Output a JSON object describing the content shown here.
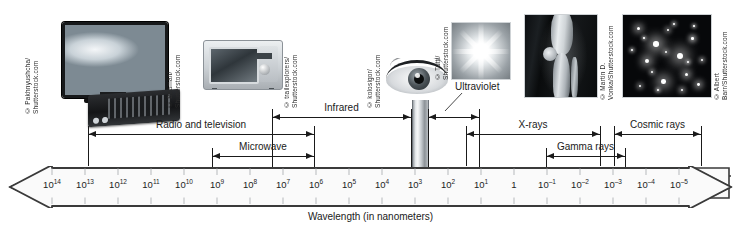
{
  "figure": {
    "caption": "Wavelength (in nanometers)",
    "axis_direction": "bidirectional"
  },
  "chart_data": {
    "type": "line",
    "xlabel": "Wavelength (in nanometers)",
    "ylabel": "",
    "orientation": "horizontal",
    "scale": "logarithmic",
    "axis_ticks": [
      {
        "label": "10¹⁴",
        "base": "10",
        "exp": "14",
        "exponent": 14,
        "x": 52
      },
      {
        "label": "10¹³",
        "base": "10",
        "exp": "13",
        "exponent": 13,
        "x": 85
      },
      {
        "label": "10¹²",
        "base": "10",
        "exp": "12",
        "exponent": 12,
        "x": 118
      },
      {
        "label": "10¹¹",
        "base": "10",
        "exp": "11",
        "exponent": 11,
        "x": 151
      },
      {
        "label": "10¹⁰",
        "base": "10",
        "exp": "10",
        "exponent": 10,
        "x": 184
      },
      {
        "label": "10⁹",
        "base": "10",
        "exp": "9",
        "exponent": 9,
        "x": 217
      },
      {
        "label": "10⁸",
        "base": "10",
        "exp": "8",
        "exponent": 8,
        "x": 250
      },
      {
        "label": "10⁷",
        "base": "10",
        "exp": "7",
        "exponent": 7,
        "x": 283
      },
      {
        "label": "10⁶",
        "base": "10",
        "exp": "6",
        "exponent": 6,
        "x": 316
      },
      {
        "label": "10⁵",
        "base": "10",
        "exp": "5",
        "exponent": 5,
        "x": 349
      },
      {
        "label": "10⁴",
        "base": "10",
        "exp": "4",
        "exponent": 4,
        "x": 382
      },
      {
        "label": "10³",
        "base": "10",
        "exp": "3",
        "exponent": 3,
        "x": 415
      },
      {
        "label": "10²",
        "base": "10",
        "exp": "2",
        "exponent": 2,
        "x": 448
      },
      {
        "label": "10¹",
        "base": "10",
        "exp": "1",
        "exponent": 1,
        "x": 481
      },
      {
        "label": "1",
        "base": "1",
        "exp": "",
        "exponent": 0,
        "x": 514
      },
      {
        "label": "10⁻¹",
        "base": "10",
        "exp": "–1",
        "exponent": -1,
        "x": 547
      },
      {
        "label": "10⁻²",
        "base": "10",
        "exp": "–2",
        "exponent": -2,
        "x": 580
      },
      {
        "label": "10⁻³",
        "base": "10",
        "exp": "–3",
        "exponent": -3,
        "x": 613
      },
      {
        "label": "10⁻⁴",
        "base": "10",
        "exp": "–4",
        "exponent": -4,
        "x": 646
      },
      {
        "label": "10⁻⁵",
        "base": "10",
        "exp": "–5",
        "exponent": -5,
        "x": 679
      }
    ],
    "bands": [
      {
        "name": "Radio and television",
        "label": "Radio and television",
        "start_exponent": 14,
        "end_exponent": 6,
        "x_start": 88,
        "x_end": 314,
        "y": 134,
        "label_y": 119,
        "arrow_left": true,
        "arrow_right": true
      },
      {
        "name": "Microwave",
        "label": "Microwave",
        "start_exponent": 9,
        "end_exponent": 6,
        "x_start": 212,
        "x_end": 314,
        "y": 156,
        "label_y": 141,
        "arrow_left": true,
        "arrow_right": true
      },
      {
        "name": "Infrared",
        "label": "Infrared",
        "start_exponent": 6,
        "end_exponent": 3,
        "x_start": 272,
        "x_end": 411,
        "y": 117,
        "label_y": 102,
        "arrow_left": true,
        "arrow_right": true
      },
      {
        "name": "Visible light",
        "label": "",
        "start_exponent": 3,
        "end_exponent": 2.6,
        "x_start": 412,
        "x_end": 427,
        "y": 117,
        "label_y": 0,
        "arrow_left": false,
        "arrow_right": false
      },
      {
        "name": "Ultraviolet",
        "label": "Ultraviolet",
        "start_exponent": 2.6,
        "end_exponent": 1,
        "x_start": 428,
        "x_end": 479,
        "y": 117,
        "label_y": 82,
        "arrow_left": true,
        "arrow_right": true
      },
      {
        "name": "X-rays",
        "label": "X-rays",
        "start_exponent": 1,
        "end_exponent": -3,
        "x_start": 466,
        "x_end": 600,
        "y": 134,
        "label_y": 119,
        "arrow_left": true,
        "arrow_right": true
      },
      {
        "name": "Gamma rays",
        "label": "Gamma rays",
        "start_exponent": -2,
        "end_exponent": -4,
        "x_start": 546,
        "x_end": 625,
        "y": 156,
        "label_y": 141,
        "arrow_left": true,
        "arrow_right": true
      },
      {
        "name": "Cosmic rays",
        "label": "Cosmic rays",
        "start_exponent": -3,
        "end_exponent": -5,
        "x_start": 614,
        "x_end": 701,
        "y": 134,
        "label_y": 119,
        "arrow_left": true,
        "arrow_right": true
      }
    ]
  },
  "images": [
    {
      "name": "television-photo",
      "credit": "© Pakhnyushcha/\nShutterstock.com"
    },
    {
      "name": "microwave-photo",
      "credit": "© Beaman/\nShutterstock.com"
    },
    {
      "name": "remote-radio-photo",
      "credit": "© trailexplorers/\nShutterstock.com"
    },
    {
      "name": "eye-photo",
      "credit": "© kolosigor/\nShutterstock.com"
    },
    {
      "name": "sun-photo",
      "credit": "© Tutti/\nShutterstock.com"
    },
    {
      "name": "xray-knee-photo",
      "credit": "© Martin D. Vonka/Shutterstock.com"
    },
    {
      "name": "cosmic-rays-photo",
      "credit": "© Albert Barr/Shutterstock.com"
    }
  ],
  "colors": {
    "background": "#ffffff",
    "ink": "#1a1a1a",
    "axis_stroke": "#3a3a3a",
    "axis_fill": "#fafafa",
    "tick": "#b6b9bc"
  }
}
